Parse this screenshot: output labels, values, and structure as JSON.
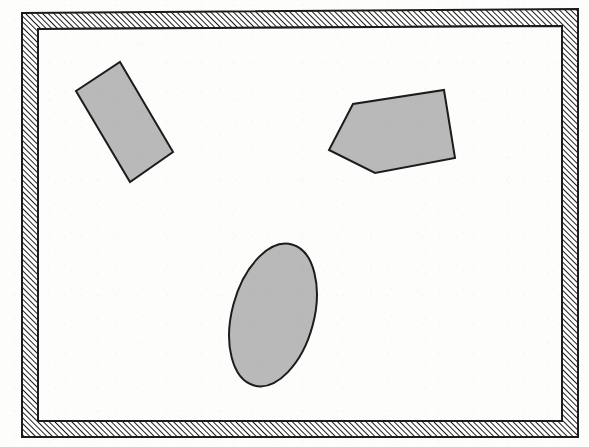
{
  "figure": {
    "title": "Hatched rectangular frame enclosing three shaded shapes",
    "canvas": {
      "width": 589,
      "height": 447
    },
    "background_color": "#fdfdfc"
  },
  "frame": {
    "name": "hatched-border-frame",
    "label": "Hatched frame",
    "fill_pattern": "diagonal-hatch-45",
    "hatch_color": "#1c1c1c",
    "hatch_background": "#ffffff",
    "hatch_spacing_px": 4,
    "outline_color": "#1c1c1c",
    "outline_width_px": 2,
    "thickness_px": 16,
    "outer_polygon": [
      [
        22,
        13
      ],
      [
        578,
        9
      ],
      [
        578,
        437
      ],
      [
        22,
        437
      ]
    ],
    "inner_polygon": [
      [
        38,
        29
      ],
      [
        562,
        26
      ],
      [
        562,
        421
      ],
      [
        38,
        421
      ]
    ]
  },
  "shapes": [
    {
      "id": "rectangle",
      "name": "tilted-rectangle",
      "label": "Tilted rectangle",
      "kind": "polygon",
      "fill_color": "#b9b9b9",
      "stroke_color": "#1c1c1c",
      "stroke_width_px": 2,
      "rotation_deg": 60,
      "points": [
        [
          120,
          62
        ],
        [
          173,
          152
        ],
        [
          130,
          182
        ],
        [
          76,
          91
        ]
      ],
      "bounding_box": {
        "x": 76,
        "y": 62,
        "width": 97,
        "height": 120
      },
      "centroid": [
        125,
        122
      ]
    },
    {
      "id": "pentagon",
      "name": "tilted-pentagon",
      "label": "Tilted pentagon",
      "kind": "polygon",
      "fill_color": "#b9b9b9",
      "stroke_color": "#1c1c1c",
      "stroke_width_px": 2,
      "points": [
        [
          444,
          90
        ],
        [
          455,
          158
        ],
        [
          375,
          173
        ],
        [
          329,
          150
        ],
        [
          353,
          104
        ]
      ],
      "bounding_box": {
        "x": 329,
        "y": 90,
        "width": 126,
        "height": 83
      },
      "centroid": [
        391,
        135
      ]
    },
    {
      "id": "ellipse",
      "name": "tilted-ellipse",
      "label": "Tilted ellipse",
      "kind": "ellipse",
      "fill_color": "#b9b9b9",
      "stroke_color": "#1c1c1c",
      "stroke_width_px": 2,
      "center": [
        273,
        315
      ],
      "radius_x": 41,
      "radius_y": 73,
      "rotation_deg": 15,
      "bounding_box": {
        "x": 232,
        "y": 242,
        "width": 82,
        "height": 146
      }
    }
  ],
  "colors": {
    "shape_fill": "#b9b9b9",
    "stroke": "#1c1c1c",
    "hatch": "#1c1c1c",
    "paper": "#fdfdfc"
  }
}
